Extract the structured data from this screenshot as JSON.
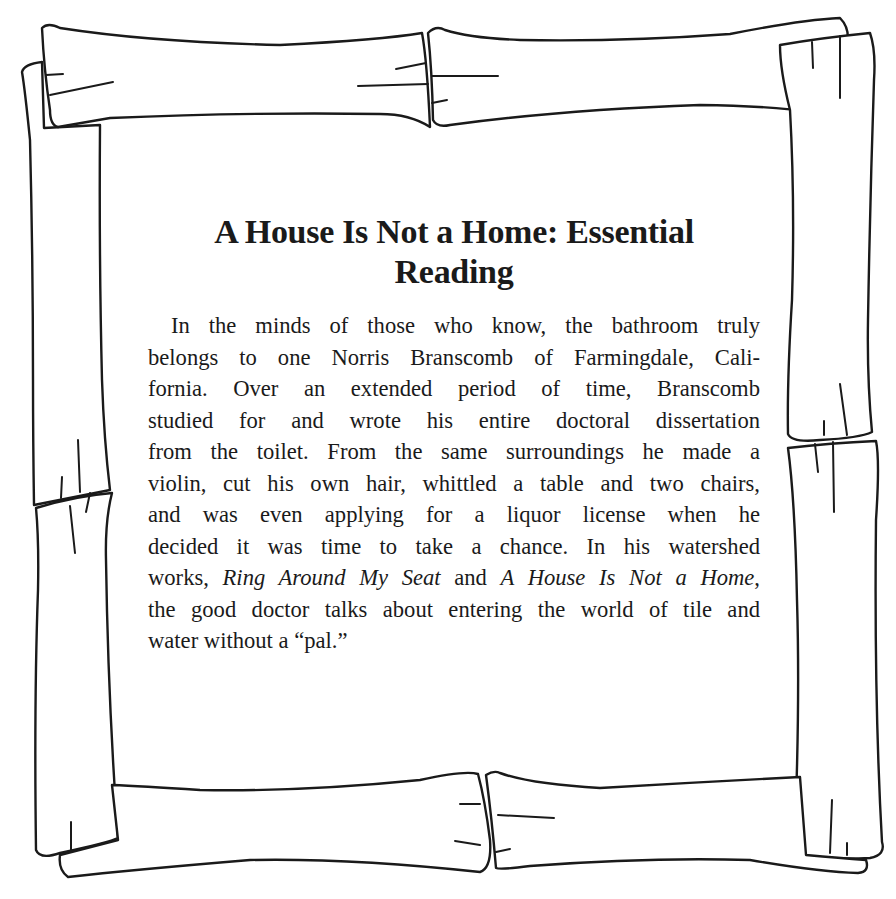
{
  "document": {
    "title": "A House Is Not a Home: Essential Reading",
    "title_lines": [
      "A House Is Not a Home: Essential",
      "Reading"
    ],
    "body_lines": [
      "In the minds of those who know, the bathroom truly",
      "belongs to one Norris Branscomb of Farmingdale, Cali-",
      "fornia. Over an extended period of time, Branscomb",
      "studied for and wrote his entire doctoral dissertation",
      "from the toilet. From the same surroundings he made a",
      "violin, cut his own hair, whittled a table and two chairs,",
      "and was even applying for a liquor license when he",
      "decided it was time to take a chance. In his watershed"
    ],
    "works_line": {
      "prefix": "works, ",
      "work_1": "Ring Around My Seat",
      "joiner": " and ",
      "work_2": "A House Is Not a Home",
      "suffix": ","
    },
    "closing_lines": [
      "the good doctor talks about entering the world of tile and",
      "water without a “pal.”"
    ]
  },
  "frame": {
    "style": "hand-drawn bamboo border",
    "stroke_color": "#1a1a1a",
    "background_color": "#ffffff"
  }
}
